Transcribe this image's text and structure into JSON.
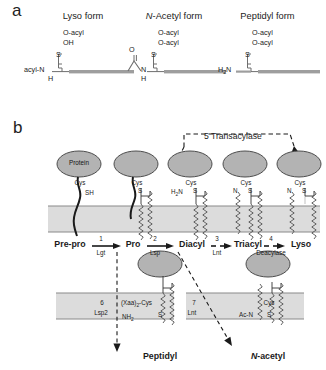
{
  "figure": {
    "panel_a": {
      "letter": "a",
      "structures": [
        {
          "title": "Lyso form",
          "title_italic_prefix": "",
          "substituents": [
            "O-acyl",
            "OH"
          ],
          "linker_atom": "S",
          "n_terminus": "acyl-N",
          "n_terminus_h": "H",
          "has_carbonyl": false
        },
        {
          "title_italic_prefix": "N",
          "title": "-Acetyl form",
          "substituents": [
            "O-acyl",
            "O-acyl"
          ],
          "linker_atom": "S",
          "n_terminus": "N",
          "n_terminus_h": "H",
          "carbonyl_label": "O",
          "has_carbonyl": true
        },
        {
          "title": "Peptidyl form",
          "title_italic_prefix": "",
          "substituents": [
            "O-acyl",
            "O-acyl"
          ],
          "linker_atom": "S",
          "n_terminus": "H2N",
          "n_terminus_h": "",
          "has_carbonyl": false
        }
      ]
    },
    "panel_b": {
      "letter": "b",
      "transacylase_label": "5 Transacylase",
      "protein_blob_label": "Protein",
      "top_row_states": [
        {
          "name": "Pre-pro",
          "cys": "Cys",
          "thiol": "SH",
          "n_label": "",
          "s_label": ""
        },
        {
          "name": "Pro",
          "cys": "Cys",
          "thiol": "",
          "n_label": "",
          "s_label": "S"
        },
        {
          "name": "Diacyl",
          "cys": "Cys",
          "thiol": "",
          "n_label": "H2N",
          "s_label": "S"
        },
        {
          "name": "Triacyl",
          "cys": "Cys",
          "thiol": "",
          "n_label": "N",
          "s_label": "S"
        },
        {
          "name": "Lyso",
          "cys": "Cys",
          "thiol": "",
          "n_label": "N",
          "s_label": "S"
        }
      ],
      "enzyme_steps": [
        {
          "number": "1",
          "name": "Lgt"
        },
        {
          "number": "2",
          "name": "Lsp"
        },
        {
          "number": "3",
          "name": "Lnt"
        },
        {
          "number": "4",
          "name": "Deacylase"
        },
        {
          "number": "6",
          "name": "Lsp2"
        },
        {
          "number": "7",
          "name": "Lnt"
        }
      ],
      "bottom_row_states": [
        {
          "name": "Peptidyl",
          "name_italic_prefix": "",
          "cys": "(Xaa)2-Cys",
          "n_label": "NH2",
          "s_label": "S"
        },
        {
          "name": "-acetyl",
          "name_italic_prefix": "N",
          "cys": "Cys",
          "n_label": "Ac-N",
          "s_label": "S"
        }
      ]
    },
    "colors": {
      "blob_fill": "#b3b3b3",
      "blob_stroke": "#4d4d4d",
      "membrane_fill": "#dcdcdc",
      "membrane_line": "#8a8a8a",
      "backbone": "#9e9e9e",
      "text": "#1b1b1b",
      "dash": "#1a1a1a"
    }
  }
}
